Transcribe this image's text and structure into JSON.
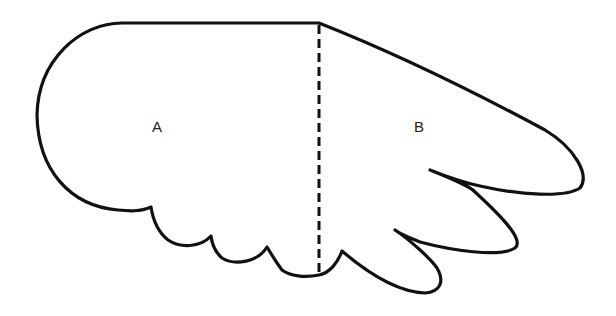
{
  "diagram": {
    "type": "wing-outline",
    "regions": [
      {
        "id": "A",
        "label": "A"
      },
      {
        "id": "B",
        "label": "B"
      }
    ],
    "divider": {
      "style": "dashed",
      "orientation": "vertical"
    },
    "colors": {
      "stroke": "#111111",
      "background": "#ffffff",
      "text": "#222222"
    }
  }
}
